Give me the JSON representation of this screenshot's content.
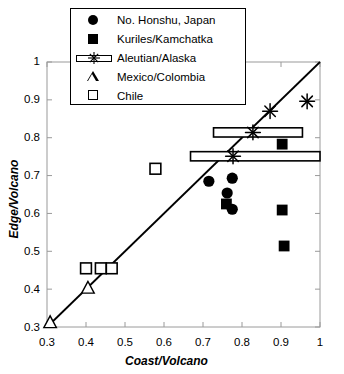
{
  "chart_data": {
    "type": "scatter",
    "title": "",
    "xlabel": "Coast/Volcano",
    "ylabel": "Edge/Volcano",
    "xlim": [
      0.3,
      1.0
    ],
    "ylim": [
      0.3,
      1.0
    ],
    "xticks": [
      "0.3",
      "0.4",
      "0.5",
      "0.6",
      "0.7",
      "0.8",
      "0.9",
      "1"
    ],
    "yticks": [
      "0.3",
      "0.4",
      "0.5",
      "0.6",
      "0.7",
      "0.8",
      "0.9",
      "1"
    ],
    "grid": false,
    "legend_position": "top-center",
    "reference_line": {
      "label": "1:1 line",
      "from": [
        0.3,
        0.3
      ],
      "to": [
        1.0,
        1.0
      ]
    },
    "series": [
      {
        "name": "No. Honshu, Japan",
        "marker": "filled-circle",
        "points": [
          {
            "x": 0.715,
            "y": 0.685
          },
          {
            "x": 0.775,
            "y": 0.693
          },
          {
            "x": 0.762,
            "y": 0.654
          },
          {
            "x": 0.775,
            "y": 0.611
          }
        ]
      },
      {
        "name": "Kuriles/Kamchatka",
        "marker": "filled-square",
        "points": [
          {
            "x": 0.903,
            "y": 0.783
          },
          {
            "x": 0.76,
            "y": 0.625
          },
          {
            "x": 0.903,
            "y": 0.609
          },
          {
            "x": 0.908,
            "y": 0.514
          }
        ]
      },
      {
        "name": "Aleutian/Alaska",
        "marker": "asterisk-with-horizontal-errorbar",
        "points": [
          {
            "x": 0.828,
            "y": 0.814,
            "xlow": 0.727,
            "xhigh": 0.955
          },
          {
            "x": 0.777,
            "y": 0.751,
            "xlow": 0.668,
            "xhigh": 1.0
          },
          {
            "x": 0.872,
            "y": 0.87
          },
          {
            "x": 0.967,
            "y": 0.896
          }
        ]
      },
      {
        "name": "Mexico/Colombia",
        "marker": "open-triangle",
        "points": [
          {
            "x": 0.405,
            "y": 0.403
          },
          {
            "x": 0.308,
            "y": 0.312
          }
        ]
      },
      {
        "name": "Chile",
        "marker": "open-square",
        "points": [
          {
            "x": 0.578,
            "y": 0.718
          },
          {
            "x": 0.4,
            "y": 0.455
          },
          {
            "x": 0.438,
            "y": 0.455
          },
          {
            "x": 0.466,
            "y": 0.455
          }
        ]
      }
    ]
  },
  "axes": {
    "x_title": "Coast/Volcano",
    "y_title": "Edge/Volcano",
    "x_tick_labels": [
      "0.3",
      "0.4",
      "0.5",
      "0.6",
      "0.7",
      "0.8",
      "0.9",
      "1"
    ],
    "y_tick_labels": [
      "1",
      "0.9",
      "0.8",
      "0.7",
      "0.6",
      "0.5",
      "0.4",
      "0.3"
    ]
  },
  "legend": {
    "items": [
      {
        "label": "No. Honshu, Japan",
        "symbol": "filled-circle"
      },
      {
        "label": "Kuriles/Kamchatka",
        "symbol": "filled-square"
      },
      {
        "label": "Aleutian/Alaska",
        "symbol": "errorbar-asterisk"
      },
      {
        "label": "Mexico/Colombia",
        "symbol": "open-triangle"
      },
      {
        "label": "Chile",
        "symbol": "open-square"
      }
    ]
  },
  "colors": {
    "marker": "#000000",
    "axis": "#808080",
    "line": "#000000",
    "background": "#ffffff"
  }
}
